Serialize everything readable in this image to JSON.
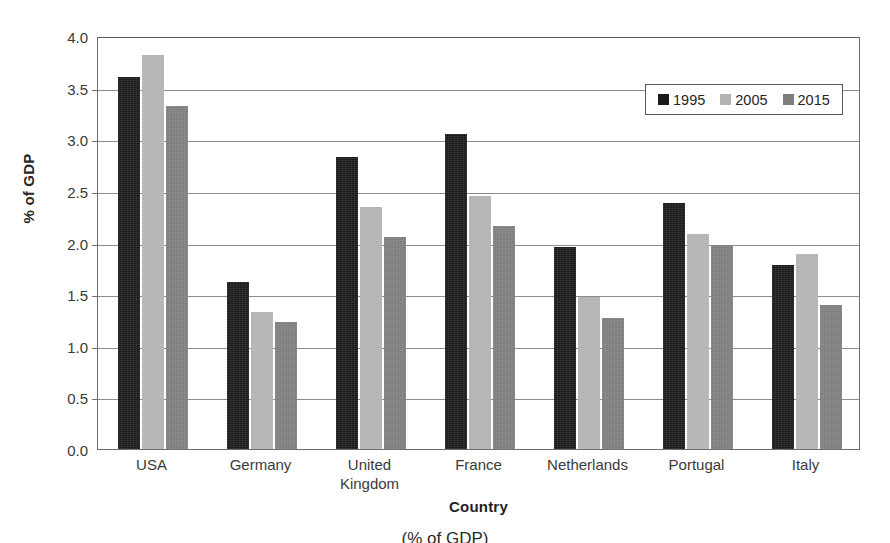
{
  "chart_data": {
    "type": "bar",
    "title": "",
    "xlabel": "Country",
    "ylabel": "% of GDP",
    "categories": [
      "USA",
      "Germany",
      "United Kingdom",
      "France",
      "Netherlands",
      "Portugal",
      "Italy"
    ],
    "category_lines": [
      [
        "USA"
      ],
      [
        "Germany"
      ],
      [
        "United",
        "Kingdom"
      ],
      [
        "France"
      ],
      [
        "Netherlands"
      ],
      [
        "Portugal"
      ],
      [
        "Italy"
      ]
    ],
    "series": [
      {
        "name": "1995",
        "color": "#1b1b1b",
        "values": [
          3.6,
          1.62,
          2.83,
          3.05,
          1.96,
          2.38,
          1.78
        ]
      },
      {
        "name": "2005",
        "color": "#b3b3b3",
        "values": [
          3.82,
          1.33,
          2.34,
          2.45,
          1.47,
          2.08,
          1.89
        ]
      },
      {
        "name": "2015",
        "color": "#7e7e7e",
        "values": [
          3.32,
          1.23,
          2.05,
          2.16,
          1.27,
          1.98,
          1.39
        ]
      }
    ],
    "ylim": [
      0.0,
      4.0
    ],
    "ytick_values": [
      0.0,
      0.5,
      1.0,
      1.5,
      2.0,
      2.5,
      3.0,
      3.5,
      4.0
    ],
    "ytick_labels": [
      "0.0",
      "0.5",
      "1.0",
      "1.5",
      "2.0",
      "2.5",
      "3.0",
      "3.5",
      "4.0"
    ],
    "grid": true,
    "legend_position": "top-right",
    "legend_entries": [
      "1995",
      "2005",
      "2015"
    ]
  },
  "caption": "(% of GDP)"
}
